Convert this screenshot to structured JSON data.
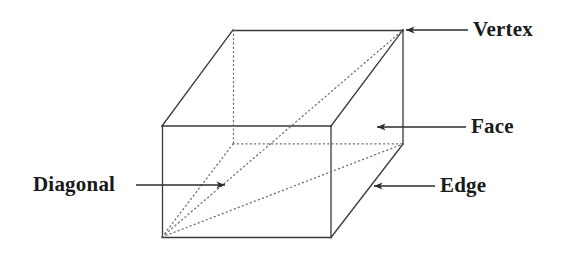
{
  "figure": {
    "shape": "rectangular-prism",
    "colors": {
      "background": "#ffffff",
      "solid_line": "#3a3a3a",
      "hidden_line": "#6e6e6e",
      "arrow": "#2b2b2b",
      "text": "#1a1a1a"
    },
    "geometry": {
      "front_top_left": [
        162,
        126
      ],
      "front_top_right": [
        331,
        126
      ],
      "front_bottom_left": [
        162,
        237
      ],
      "front_bottom_right": [
        331,
        237
      ],
      "back_top_left": [
        233,
        30
      ],
      "back_top_right": [
        403,
        30
      ],
      "back_bottom_left": [
        233,
        144
      ],
      "back_bottom_right": [
        403,
        144
      ]
    },
    "hidden_edges": [
      "back_top_left-back_bottom_left",
      "back_bottom_left-back_bottom_right",
      "front_bottom_left-back_bottom_right"
    ],
    "diagonal": {
      "from": "front_bottom_left",
      "to": "back_top_right",
      "style": "dotted"
    }
  },
  "labels": [
    {
      "id": "vertex",
      "text": "Vertex",
      "points_to": "back_top_right",
      "arrow_direction": "left"
    },
    {
      "id": "face",
      "text": "Face",
      "points_to": "right-side-face",
      "arrow_direction": "left"
    },
    {
      "id": "edge",
      "text": "Edge",
      "points_to": "front_bottom_right-back_bottom_right-edge",
      "arrow_direction": "left"
    },
    {
      "id": "diagonal",
      "text": "Diagonal",
      "points_to": "space-diagonal",
      "arrow_direction": "right"
    }
  ]
}
